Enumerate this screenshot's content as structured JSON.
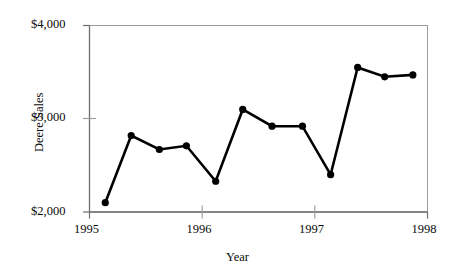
{
  "chart_data": {
    "type": "line",
    "title": "",
    "xlabel": "Year",
    "ylabel": "Deere Sales",
    "xlim": [
      1995,
      1998
    ],
    "ylim": [
      2000,
      4000
    ],
    "xticks": [
      1995,
      1996,
      1997,
      1998
    ],
    "xtick_labels": [
      "1995",
      "1996",
      "1997",
      "1998"
    ],
    "yticks": [
      2000,
      3000,
      4000
    ],
    "ytick_labels": [
      "$2,000",
      "$3,000",
      "$4,000"
    ],
    "grid": false,
    "legend": false,
    "marker": "filled-circle",
    "line_color": "#000000",
    "marker_color": "#000000",
    "frame_color": "#9a9a9a",
    "x": [
      1995.14,
      1995.37,
      1995.62,
      1995.86,
      1996.12,
      1996.36,
      1996.62,
      1996.89,
      1997.14,
      1997.38,
      1997.62,
      1997.87
    ],
    "values": [
      2100,
      2820,
      2670,
      2710,
      2330,
      3100,
      2920,
      2920,
      2400,
      3550,
      3450,
      3470
    ],
    "points": [
      {
        "x": 1995.14,
        "y": 2100
      },
      {
        "x": 1995.37,
        "y": 2820
      },
      {
        "x": 1995.62,
        "y": 2670
      },
      {
        "x": 1995.86,
        "y": 2710
      },
      {
        "x": 1996.12,
        "y": 2330
      },
      {
        "x": 1996.36,
        "y": 3100
      },
      {
        "x": 1996.62,
        "y": 2920
      },
      {
        "x": 1996.89,
        "y": 2920
      },
      {
        "x": 1997.14,
        "y": 2400
      },
      {
        "x": 1997.38,
        "y": 3550
      },
      {
        "x": 1997.62,
        "y": 3450
      },
      {
        "x": 1997.87,
        "y": 3470
      }
    ]
  },
  "axes": {
    "y_tick_3": "$4,000",
    "y_tick_2": "$3,000",
    "y_tick_1": "$2,000",
    "x_tick_1": "1995",
    "x_tick_2": "1996",
    "x_tick_3": "1997",
    "x_tick_4": "1998",
    "y_title": "Deere Sales",
    "x_title": "Year"
  }
}
